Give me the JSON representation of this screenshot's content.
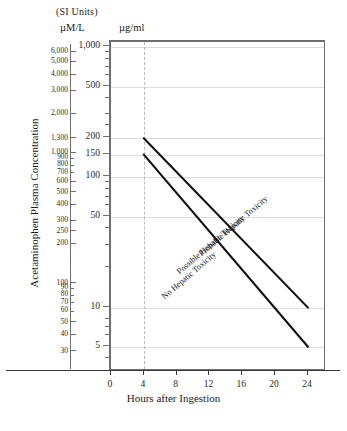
{
  "figure": {
    "si_units_note": "(SI Units)",
    "left_axis_unit": "µM/L",
    "right_axis_unit": "µg/ml",
    "y_title": "Acetaminophen Plasma Concentration",
    "x_title": "Hours after Ingestion",
    "footer": ""
  },
  "chart_data": {
    "type": "line",
    "xlabel": "Hours after Ingestion",
    "ylabel": "Acetaminophen Plasma Concentration",
    "yscale": "log",
    "xlim": [
      0,
      26
    ],
    "ylim_ug_ml": [
      3,
      1000
    ],
    "grid": true,
    "legend": "inline-diagonal-labels",
    "x_ticks": [
      0,
      4,
      8,
      12,
      16,
      20,
      24
    ],
    "y_ticks_ug_ml": [
      1000,
      500,
      200,
      150,
      100,
      50,
      10,
      5
    ],
    "y_ticks_umol_l": [
      6000,
      5000,
      4000,
      3000,
      2000,
      1300,
      1000,
      900,
      800,
      700,
      600,
      500,
      400,
      300,
      250,
      200,
      100,
      90,
      80,
      70,
      60,
      50,
      40,
      30,
      20,
      10
    ],
    "y_gridlines_ug_ml": [
      1000,
      500,
      200,
      150,
      100,
      50,
      10,
      5
    ],
    "vertical_reference_hour": 4,
    "series": [
      {
        "name": "Probable Hepatic Toxicity",
        "label": "Probable Hepatic Toxicity",
        "x": [
          4,
          24
        ],
        "y_ug_ml": [
          200,
          10
        ],
        "y_umol_l": [
          1300,
          66
        ]
      },
      {
        "name": "Possible Hepatic Toxicity",
        "label": "Possible Hepatic Toxicity",
        "x": [
          4,
          24
        ],
        "y_ug_ml": [
          150,
          5
        ],
        "y_umol_l": [
          1000,
          33
        ]
      },
      {
        "name": "No Hepatic Toxicity",
        "label": "No Hepatic Toxicity",
        "x": [
          4,
          24
        ],
        "y_ug_ml": null,
        "y_umol_l": null
      }
    ],
    "zone_labels": [
      "Probable Hepatic Toxicity",
      "Possible Hepatic Toxicity",
      "No Hepatic Toxicity"
    ]
  },
  "axis_left": {
    "ticks": [
      {
        "v": "6,000",
        "major": true
      },
      {
        "v": "5,000",
        "major": true
      },
      {
        "v": "4,000",
        "major": true
      },
      {
        "v": "3,000",
        "major": true
      },
      {
        "v": "2,000",
        "major": true
      },
      {
        "v": "1,300",
        "major": true
      },
      {
        "v": "1,000",
        "major": true
      },
      {
        "v": "900",
        "major": false
      },
      {
        "v": "800",
        "major": false
      },
      {
        "v": "700",
        "major": false
      },
      {
        "v": "600",
        "major": true
      },
      {
        "v": "500",
        "major": true
      },
      {
        "v": "400",
        "major": true
      },
      {
        "v": "300",
        "major": true
      },
      {
        "v": "250",
        "major": true
      },
      {
        "v": "200",
        "major": true
      },
      {
        "v": "100",
        "major": true
      },
      {
        "v": "90",
        "major": false
      },
      {
        "v": "80",
        "major": false
      },
      {
        "v": "70",
        "major": false
      },
      {
        "v": "60",
        "major": false
      },
      {
        "v": "50",
        "major": true
      },
      {
        "v": "40",
        "major": true
      },
      {
        "v": "30",
        "major": true
      },
      {
        "v": "20",
        "major": true
      },
      {
        "v": "10",
        "major": true
      }
    ]
  },
  "axis_right": {
    "ticks": [
      {
        "v": "1,000"
      },
      {
        "v": "500"
      },
      {
        "v": "200"
      },
      {
        "v": "150"
      },
      {
        "v": "100"
      },
      {
        "v": "50"
      },
      {
        "v": "10"
      },
      {
        "v": "5"
      }
    ]
  },
  "axis_x": {
    "ticks": [
      "0",
      "4",
      "8",
      "12",
      "16",
      "20",
      "24"
    ]
  }
}
